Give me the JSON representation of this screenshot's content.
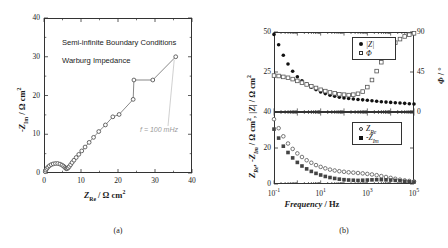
{
  "figure": {
    "panel_a_caption": "(a)",
    "panel_b_caption": "(b)"
  },
  "panel_a": {
    "note_line1": "Semi-infinite Boundary Conditions",
    "note_line2": "Warburg Impedance",
    "annotation": "f = 100 mHz",
    "xlabel_main": "Z",
    "xlabel_sub": "Re",
    "xlabel_unit": " / Ω cm",
    "xlabel_exp": "2",
    "ylabel_main": "-Z",
    "ylabel_sub": "Im",
    "ylabel_unit": " / Ω cm",
    "ylabel_exp": "2",
    "xticks": [
      "0",
      "10",
      "20",
      "30",
      "40"
    ],
    "yticks": [
      "0",
      "10",
      "20",
      "30",
      "40"
    ]
  },
  "panel_b": {
    "xlabel_italic": "Frequency",
    "xlabel_rest": " / Hz",
    "xticks": [
      "10",
      "10",
      "10",
      "10"
    ],
    "xtick_exps": [
      "-1",
      "1",
      "3",
      "5"
    ],
    "ylabel_a": "Z",
    "ylabel_a_sub": "Re",
    "ylabel_b": ", -Z",
    "ylabel_b_sub": "Im",
    "ylabel_c": " / Ω cm",
    "ylabel_c_exp": "2",
    "ylabel_d": ", |Z| / Ω cm",
    "ylabel_d_exp": "2",
    "right_label_main": "Φ",
    "right_label_unit": " / °",
    "top_yticks": [
      "50",
      "25"
    ],
    "bottom_yticks": [
      "40",
      "20",
      "0"
    ],
    "right_yticks": [
      "90",
      "45",
      "0"
    ],
    "legend_top": [
      {
        "symbol": "filled-circle",
        "label": "|Z|"
      },
      {
        "symbol": "open-square",
        "label": "Φ"
      }
    ],
    "legend_bottom": [
      {
        "symbol": "open-circle",
        "label_main": "Z",
        "label_sub": "Re"
      },
      {
        "symbol": "filled-square",
        "label_main": "-Z",
        "label_sub": "Im"
      }
    ]
  },
  "chart_data": [
    {
      "type": "scatter",
      "id": "nyquist",
      "title": "Nyquist plot — Warburg impedance, semi-infinite boundary conditions",
      "xlabel": "Z_Re / Ω cm^2",
      "ylabel": "-Z_Im / Ω cm^2",
      "xlim": [
        0,
        40
      ],
      "ylim": [
        0,
        40
      ],
      "xticks": [
        0,
        10,
        20,
        30,
        40
      ],
      "yticks": [
        0,
        10,
        20,
        30,
        40
      ],
      "marker": "open-circle",
      "line": true,
      "grid": false,
      "annotation": {
        "text": "f = 100 mHz",
        "x": 35.6,
        "y": 30.0
      },
      "points": [
        [
          0.35,
          0.35
        ],
        [
          0.5,
          0.75
        ],
        [
          0.75,
          1.15
        ],
        [
          1.05,
          1.5
        ],
        [
          1.45,
          1.85
        ],
        [
          1.95,
          2.15
        ],
        [
          2.5,
          2.35
        ],
        [
          3.1,
          2.45
        ],
        [
          3.7,
          2.45
        ],
        [
          4.3,
          2.3
        ],
        [
          4.85,
          2.05
        ],
        [
          5.3,
          1.75
        ],
        [
          5.65,
          1.45
        ],
        [
          5.9,
          1.2
        ],
        [
          6.1,
          1.1
        ],
        [
          6.3,
          1.15
        ],
        [
          6.55,
          1.35
        ],
        [
          6.85,
          1.7
        ],
        [
          7.2,
          2.15
        ],
        [
          7.6,
          2.7
        ],
        [
          8.1,
          3.3
        ],
        [
          8.7,
          4.0
        ],
        [
          9.4,
          4.8
        ],
        [
          10.2,
          5.7
        ],
        [
          11.1,
          6.7
        ],
        [
          12.2,
          7.9
        ],
        [
          13.4,
          9.2
        ],
        [
          14.8,
          10.7
        ],
        [
          16.6,
          12.4
        ],
        [
          18.6,
          14.5
        ],
        [
          20.3,
          15.1
        ],
        [
          24.1,
          19.0
        ],
        [
          24.3,
          24.0
        ],
        [
          29.4,
          24.0
        ],
        [
          35.6,
          30.0
        ]
      ]
    },
    {
      "type": "scatter",
      "id": "bode-magnitude-phase",
      "title": "Bode plot — |Z| and phase angle vs frequency",
      "xlabel": "Frequency / Hz",
      "ylabel": "|Z| / Ω cm^2",
      "ylabel_right": "Φ / °",
      "xscale": "log",
      "xlim": [
        0.1,
        100000
      ],
      "ylim": [
        0,
        50
      ],
      "ylim_right": [
        0,
        90
      ],
      "yticks": [
        25,
        50
      ],
      "yticks_right": [
        0,
        45,
        90
      ],
      "grid": false,
      "series": [
        {
          "name": "|Z|",
          "marker": "filled-circle",
          "axis": "left",
          "points": [
            [
              0.1,
              48.5
            ],
            [
              0.158,
              42.0
            ],
            [
              0.251,
              35.5
            ],
            [
              0.398,
              30.0
            ],
            [
              0.631,
              25.5
            ],
            [
              1.0,
              22.0
            ],
            [
              1.58,
              19.5
            ],
            [
              2.51,
              17.5
            ],
            [
              3.98,
              15.5
            ],
            [
              6.31,
              14.0
            ],
            [
              10.0,
              12.5
            ],
            [
              15.8,
              11.5
            ],
            [
              25.1,
              10.5
            ],
            [
              39.8,
              9.8
            ],
            [
              63.1,
              9.2
            ],
            [
              100,
              8.8
            ],
            [
              158,
              8.4
            ],
            [
              251,
              8.1
            ],
            [
              398,
              7.8
            ],
            [
              631,
              7.6
            ],
            [
              1000,
              7.3
            ],
            [
              1580,
              7.0
            ],
            [
              2510,
              6.7
            ],
            [
              3980,
              6.4
            ],
            [
              6310,
              6.2
            ],
            [
              10000,
              6.0
            ],
            [
              15800,
              5.8
            ],
            [
              25100,
              5.6
            ],
            [
              39800,
              5.4
            ],
            [
              63100,
              5.2
            ],
            [
              100000,
              5.0
            ]
          ]
        },
        {
          "name": "Φ",
          "marker": "open-square",
          "axis": "right",
          "points": [
            [
              0.1,
              41.0
            ],
            [
              0.158,
              40.5
            ],
            [
              0.251,
              39.5
            ],
            [
              0.398,
              38.5
            ],
            [
              0.631,
              37.0
            ],
            [
              1.0,
              35.0
            ],
            [
              1.58,
              33.0
            ],
            [
              2.51,
              31.0
            ],
            [
              3.98,
              29.0
            ],
            [
              6.31,
              27.0
            ],
            [
              10.0,
              25.0
            ],
            [
              15.8,
              23.5
            ],
            [
              25.1,
              22.0
            ],
            [
              39.8,
              21.0
            ],
            [
              63.1,
              20.0
            ],
            [
              100,
              19.5
            ],
            [
              158,
              19.0
            ],
            [
              251,
              19.5
            ],
            [
              398,
              20.5
            ],
            [
              631,
              23.0
            ],
            [
              1000,
              28.0
            ],
            [
              1580,
              36.0
            ],
            [
              2510,
              46.0
            ],
            [
              3980,
              56.0
            ],
            [
              6310,
              65.0
            ],
            [
              10000,
              72.0
            ],
            [
              15800,
              78.0
            ],
            [
              25100,
              82.0
            ],
            [
              39800,
              85.0
            ],
            [
              63100,
              87.0
            ],
            [
              100000,
              88.5
            ]
          ]
        }
      ]
    },
    {
      "type": "scatter",
      "id": "bode-real-imag",
      "title": "Bode plot — real and imaginary impedance vs frequency",
      "xlabel": "Frequency / Hz",
      "ylabel": "Z_Re, -Z_Im / Ω cm^2",
      "xscale": "log",
      "xlim": [
        0.1,
        100000
      ],
      "ylim": [
        0,
        40
      ],
      "yticks": [
        0,
        20,
        40
      ],
      "grid": false,
      "series": [
        {
          "name": "Z_Re",
          "marker": "open-circle",
          "points": [
            [
              0.1,
              36.0
            ],
            [
              0.158,
              31.0
            ],
            [
              0.251,
              26.5
            ],
            [
              0.398,
              22.5
            ],
            [
              0.631,
              19.5
            ],
            [
              1.0,
              17.0
            ],
            [
              1.58,
              15.0
            ],
            [
              2.51,
              13.2
            ],
            [
              3.98,
              11.8
            ],
            [
              6.31,
              10.5
            ],
            [
              10.0,
              9.5
            ],
            [
              15.8,
              8.7
            ],
            [
              25.1,
              8.0
            ],
            [
              39.8,
              7.5
            ],
            [
              63.1,
              7.1
            ],
            [
              100,
              6.8
            ],
            [
              158,
              6.5
            ],
            [
              251,
              6.3
            ],
            [
              398,
              6.1
            ],
            [
              631,
              5.9
            ],
            [
              1000,
              5.6
            ],
            [
              1580,
              5.3
            ],
            [
              2510,
              4.9
            ],
            [
              3980,
              4.4
            ],
            [
              6310,
              3.9
            ],
            [
              10000,
              3.4
            ],
            [
              15800,
              2.9
            ],
            [
              25100,
              2.4
            ],
            [
              39800,
              2.0
            ],
            [
              63100,
              1.7
            ],
            [
              100000,
              1.4
            ]
          ]
        },
        {
          "name": "-Z_Im",
          "marker": "filled-square",
          "points": [
            [
              0.1,
              30.5
            ],
            [
              0.158,
              25.5
            ],
            [
              0.251,
              21.0
            ],
            [
              0.398,
              17.5
            ],
            [
              0.631,
              14.5
            ],
            [
              1.0,
              12.0
            ],
            [
              1.58,
              10.0
            ],
            [
              2.51,
              8.4
            ],
            [
              3.98,
              7.0
            ],
            [
              6.31,
              5.9
            ],
            [
              10.0,
              5.0
            ],
            [
              15.8,
              4.2
            ],
            [
              25.1,
              3.6
            ],
            [
              39.8,
              3.1
            ],
            [
              63.1,
              2.7
            ],
            [
              100,
              2.4
            ],
            [
              158,
              2.2
            ],
            [
              251,
              2.1
            ],
            [
              398,
              2.0
            ],
            [
              631,
              2.1
            ],
            [
              1000,
              2.2
            ],
            [
              1580,
              2.3
            ],
            [
              2510,
              2.4
            ],
            [
              3980,
              2.4
            ],
            [
              6310,
              2.3
            ],
            [
              10000,
              2.2
            ],
            [
              15800,
              2.0
            ],
            [
              25100,
              1.8
            ],
            [
              39800,
              1.5
            ],
            [
              63100,
              1.3
            ],
            [
              100000,
              1.1
            ]
          ]
        }
      ]
    }
  ]
}
